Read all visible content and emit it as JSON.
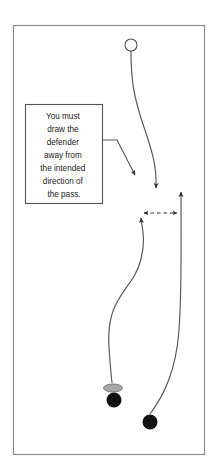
{
  "diagram": {
    "type": "sports-play-diagram",
    "title": "",
    "border": {
      "x": 13,
      "y": 25,
      "width": 192,
      "height": 430,
      "stroke": "#808080",
      "stroke_width": 1,
      "fill": "#ffffff"
    },
    "callout": {
      "name": "instruction-callout",
      "box": {
        "x": 25,
        "y": 104,
        "width": 78,
        "height": 100
      },
      "stroke": "#555555",
      "fill": "#ffffff",
      "text_lines": [
        "You must",
        "draw the",
        "defender",
        "away from",
        "the intended",
        "direction of",
        "the pass."
      ],
      "text_color": "#1a1a1a",
      "leader_line": {
        "name": "callout-leader-line",
        "points": "103,140 117,140 137,178",
        "arrow_at": {
          "x": 137,
          "y": 178
        },
        "stroke": "#555555"
      }
    },
    "markers": [
      {
        "name": "offense-player-open-circle",
        "shape": "open-circle",
        "cx": 131,
        "cy": 45,
        "r": 6,
        "fill": "#ffffff",
        "stroke": "#555555"
      },
      {
        "name": "puck-gray-ellipse",
        "shape": "ellipse",
        "cx": 113,
        "cy": 388,
        "rx": 9,
        "ry": 4,
        "fill": "#a8a8a8",
        "stroke": "#6e6e6e"
      },
      {
        "name": "defender-filled-circle-left",
        "shape": "filled-circle",
        "cx": 114,
        "cy": 400,
        "r": 7.5,
        "fill": "#111111",
        "stroke": "#111111"
      },
      {
        "name": "receiver-filled-circle-right",
        "shape": "filled-circle",
        "cx": 150,
        "cy": 422,
        "r": 7.5,
        "fill": "#111111",
        "stroke": "#111111"
      }
    ],
    "paths": [
      {
        "name": "defender-drive-path",
        "style": "solid-curve-with-arrow",
        "d": "M131,51 C131,80 134,95 141,118 C150,146 157,160 156,186",
        "stroke": "#555555",
        "arrow_at": {
          "x": 156,
          "y": 196,
          "angle": 100
        }
      },
      {
        "name": "puck-carrier-curl-path",
        "style": "solid-curve-with-arrow",
        "d": "M113,384 C110,350 107,330 113,310 C121,286 134,282 140,258 C145,238 142,228 141,220",
        "stroke": "#555555",
        "arrow_at": {
          "x": 140,
          "y": 213,
          "angle": -80
        }
      },
      {
        "name": "receiver-cut-path",
        "style": "solid-curve-with-arrow",
        "d": "M150,414 C163,396 175,372 179,330 C182,290 181,240 181,194",
        "stroke": "#555555",
        "arrow_at": {
          "x": 181,
          "y": 186,
          "angle": -90
        }
      },
      {
        "name": "pass-lane-dashed-arrow",
        "style": "dashed-double-arrow",
        "from": {
          "x": 140,
          "y": 213
        },
        "to": {
          "x": 181,
          "y": 213
        },
        "stroke": "#333333",
        "dash": "3.5,3"
      }
    ]
  }
}
